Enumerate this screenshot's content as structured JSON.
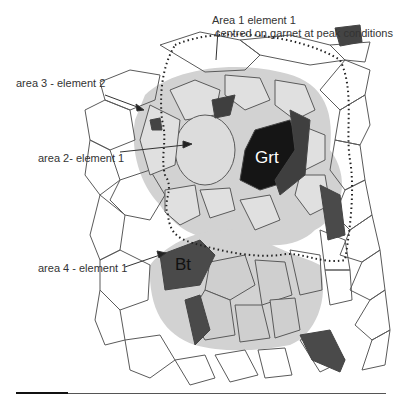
{
  "diagram": {
    "type": "petrological grain schematic",
    "annotations": [
      {
        "id": "area1",
        "line1": "Area 1 element 1",
        "line2": "centred on garnet at peak conditions"
      },
      {
        "id": "area3",
        "text": "area 3 - element 2"
      },
      {
        "id": "area2",
        "text": "area 2- element 1"
      },
      {
        "id": "area4",
        "text": "area 4 - element 1"
      }
    ],
    "minerals": [
      {
        "id": "garnet",
        "label": "Grt"
      },
      {
        "id": "biotite",
        "label": "Bt"
      }
    ],
    "colors": {
      "background": "#ffffff",
      "grain_outline": "#555555",
      "light_shade": "#d2d2d2",
      "medium_shade": "#b4b4b4",
      "dark_grain": "#505050",
      "garnet": "#151515",
      "dotted_boundary": "#222222"
    }
  }
}
